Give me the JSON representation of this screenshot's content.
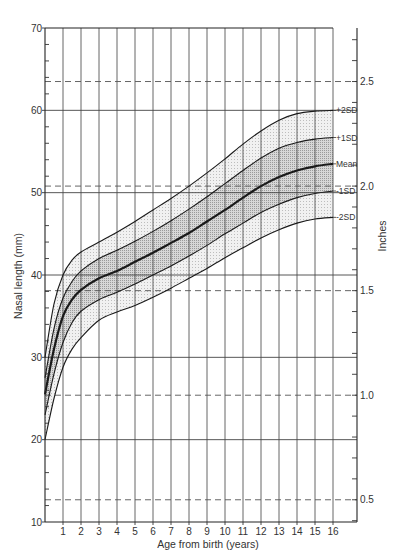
{
  "chart_data": {
    "type": "line",
    "title": "",
    "xlabel": "Age from birth (years)",
    "ylabel": "Nasal length (mm)",
    "y2label": "Inches",
    "xlim": [
      0,
      16
    ],
    "ylim": [
      10,
      70
    ],
    "y2lim_inches": [
      0.39,
      2.76
    ],
    "x_ticks": [
      1,
      2,
      3,
      4,
      5,
      6,
      7,
      8,
      9,
      10,
      11,
      12,
      13,
      14,
      15,
      16
    ],
    "y_ticks": [
      10,
      20,
      30,
      40,
      50,
      60,
      70
    ],
    "y2_ticks": [
      0.5,
      1.0,
      1.5,
      2.0,
      2.5
    ],
    "y2_tick_labels": [
      "0.5",
      "1.0",
      "1.5",
      "2.0",
      "2.5"
    ],
    "grid": {
      "vertical_every_year": true,
      "horizontal_mm": [
        20,
        30,
        40,
        50,
        60
      ],
      "horizontal_dashed_inches": [
        0.5,
        1.0,
        1.5,
        2.0,
        2.5
      ]
    },
    "x": [
      0,
      0.5,
      1,
      1.5,
      2,
      3,
      4,
      5,
      6,
      7,
      8,
      9,
      10,
      11,
      12,
      13,
      14,
      15,
      16
    ],
    "series": [
      {
        "name": "+2SD",
        "values": [
          30.0,
          36.5,
          40.0,
          41.8,
          42.8,
          44.0,
          45.2,
          46.5,
          47.9,
          49.3,
          50.8,
          52.4,
          54.1,
          55.9,
          57.5,
          58.8,
          59.6,
          59.9,
          60.0
        ]
      },
      {
        "name": "+1SD",
        "values": [
          27.5,
          33.5,
          37.2,
          39.2,
          40.5,
          42.0,
          43.0,
          44.1,
          45.3,
          46.6,
          48.0,
          49.5,
          51.1,
          52.7,
          54.2,
          55.4,
          56.1,
          56.5,
          56.7
        ]
      },
      {
        "name": "Mean",
        "values": [
          25.5,
          31.0,
          35.0,
          37.0,
          38.2,
          39.6,
          40.5,
          41.6,
          42.7,
          43.9,
          45.1,
          46.5,
          47.9,
          49.4,
          50.8,
          51.9,
          52.7,
          53.2,
          53.5
        ]
      },
      {
        "name": "-1SD",
        "values": [
          23.0,
          28.0,
          31.8,
          34.2,
          35.6,
          37.0,
          37.9,
          38.9,
          40.0,
          41.1,
          42.3,
          43.6,
          45.0,
          46.3,
          47.6,
          48.6,
          49.4,
          49.9,
          50.2
        ]
      },
      {
        "name": "-2SD",
        "values": [
          20.0,
          25.0,
          28.8,
          31.0,
          32.4,
          34.5,
          35.5,
          36.3,
          37.3,
          38.4,
          39.6,
          40.8,
          42.1,
          43.3,
          44.5,
          45.5,
          46.3,
          46.8,
          47.0
        ]
      }
    ],
    "legend_position": "right-inline",
    "annotations": [
      "+2SD",
      "+1SD",
      "Mean",
      "-1SD",
      "-2SD"
    ]
  },
  "labels": {
    "xlabel": "Age from birth (years)",
    "ylabel": "Nasal length (mm)",
    "y2label": "Inches"
  },
  "colors": {
    "line": "#1a1a1a",
    "grid": "#555555",
    "outer_band": "#e6e6e6",
    "inner_band": "#c9c9c9",
    "text": "#333333"
  }
}
